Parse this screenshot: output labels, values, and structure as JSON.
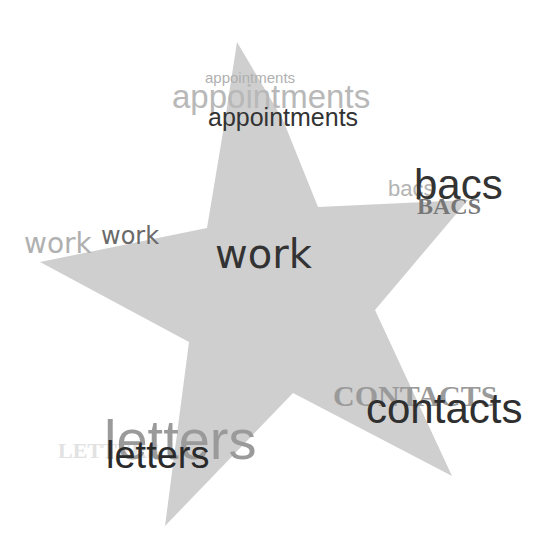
{
  "canvas": {
    "width": 556,
    "height": 542,
    "background": "#ffffff"
  },
  "star": {
    "fill": "#cfcfcf",
    "points": "237,42 283,120 318,207 468,200 375,310 452,476 293,393 165,526 189,342 40,262 207,228 225,120"
  },
  "words": {
    "appointments_small": {
      "text": "appointments",
      "color": "#b0b0b0"
    },
    "appointments_medium": {
      "text": "appointments",
      "color": "#b8b8b8"
    },
    "appointments_dark": {
      "text": "appointments",
      "color": "#333333"
    },
    "bacs_faint": {
      "text": "bacs",
      "color": "#b4b4b4"
    },
    "bacs_serif": {
      "text": "BACS",
      "color": "#777777"
    },
    "bacs_dark": {
      "text": "bacs",
      "color": "#333333"
    },
    "work_left_faint": {
      "text": "work",
      "color": "#b0b0b0"
    },
    "work_left_mid": {
      "text": "work",
      "color": "#6a6a6a"
    },
    "work_center": {
      "text": "work",
      "color": "#333333"
    },
    "contacts_serif": {
      "text": "CONTACTS",
      "color": "#9a9a9a"
    },
    "contacts_dark": {
      "text": "contacts",
      "color": "#2f2f2f"
    },
    "letters_faint_serif": {
      "text": "LETTERS",
      "color": "#e2e2e2"
    },
    "letters_big": {
      "text": "letters",
      "color": "#9a9a9a"
    },
    "letters_dark": {
      "text": "letters",
      "color": "#2a2a2a"
    }
  }
}
